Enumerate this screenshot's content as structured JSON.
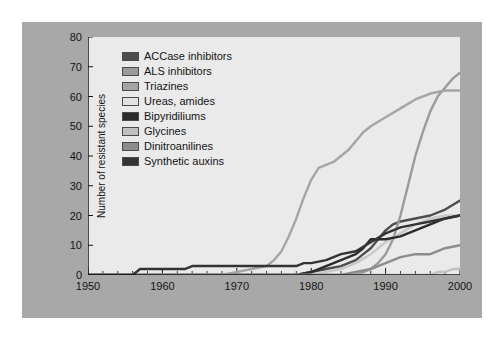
{
  "figure": {
    "background_color": "#a8a8a8",
    "plot_background_color": "#eaeaea",
    "page_color": "#ffffff"
  },
  "chart_data": {
    "type": "line",
    "title": "",
    "subtitle": "",
    "xlabel": "",
    "ylabel": "Number of resistant species",
    "xlim": [
      1950,
      2000
    ],
    "ylim": [
      0,
      80
    ],
    "xticks": [
      1950,
      1960,
      1970,
      1980,
      1990,
      2000
    ],
    "xtick_labels": [
      "1950",
      "1960",
      "1970",
      "1980",
      "1990",
      "2000"
    ],
    "yticks": [
      0,
      10,
      20,
      30,
      40,
      50,
      60,
      70,
      80
    ],
    "ytick_labels": [
      "0",
      "10",
      "20",
      "30",
      "40",
      "50",
      "60",
      "70",
      "80"
    ],
    "minor_ticks_x": true,
    "minor_tick_interval_x": 2,
    "grid": false,
    "legend_position": "upper left (inside axes)",
    "series": [
      {
        "name": "ACCase inhibitors",
        "color": "#4d4d4d",
        "x": [
          1950,
          1978,
          1980,
          1982,
          1984,
          1986,
          1987,
          1988,
          1989,
          1990,
          1991,
          1992,
          1994,
          1996,
          1998,
          2000
        ],
        "values": [
          0,
          0,
          1,
          2,
          3,
          5,
          7,
          9,
          12,
          15,
          17,
          18,
          19,
          20,
          22,
          25
        ]
      },
      {
        "name": "ALS inhibitors",
        "color": "#9a9a9a",
        "x": [
          1950,
          1986,
          1987,
          1988,
          1989,
          1990,
          1991,
          1992,
          1993,
          1994,
          1995,
          1996,
          1997,
          1998,
          1999,
          2000
        ],
        "values": [
          0,
          0,
          1,
          2,
          4,
          7,
          12,
          20,
          30,
          40,
          48,
          55,
          60,
          63,
          66,
          68
        ]
      },
      {
        "name": "Triazines",
        "color": "#a5a5a5",
        "x": [
          1950,
          1968,
          1970,
          1972,
          1974,
          1975,
          1976,
          1977,
          1978,
          1979,
          1980,
          1981,
          1982,
          1983,
          1984,
          1985,
          1986,
          1987,
          1988,
          1990,
          1992,
          1994,
          1996,
          1998,
          2000
        ],
        "values": [
          0,
          0,
          1,
          2,
          3,
          5,
          8,
          13,
          19,
          26,
          32,
          36,
          37,
          38,
          40,
          42,
          45,
          48,
          50,
          53,
          56,
          59,
          61,
          62,
          62
        ]
      },
      {
        "name": "Ureas, amides",
        "color": "#c9c9c9",
        "x": [
          1950,
          1980,
          1982,
          1984,
          1986,
          1988,
          1990,
          1992,
          1994,
          1996,
          1998,
          2000
        ],
        "values": [
          0,
          0,
          1,
          2,
          4,
          7,
          11,
          14,
          17,
          19,
          20,
          20
        ]
      },
      {
        "name": "Bipyridiliums",
        "color": "#2b2b2b",
        "x": [
          1950,
          1978,
          1980,
          1982,
          1984,
          1986,
          1987,
          1988,
          1990,
          1992,
          1994,
          1996,
          1998,
          2000
        ],
        "values": [
          0,
          0,
          1,
          3,
          5,
          7,
          9,
          12,
          12,
          13,
          15,
          17,
          19,
          20
        ]
      },
      {
        "name": "Glycines",
        "color": "#c0c0c0",
        "x": [
          1950,
          1994,
          1996,
          1997,
          1998,
          1999,
          2000
        ],
        "values": [
          0,
          0,
          0,
          1,
          1,
          2,
          2
        ]
      },
      {
        "name": "Dinitroanilines",
        "color": "#8c8c8c",
        "x": [
          1950,
          1984,
          1986,
          1988,
          1990,
          1992,
          1994,
          1996,
          1998,
          2000
        ],
        "values": [
          0,
          0,
          1,
          2,
          4,
          6,
          7,
          7,
          9,
          10
        ]
      },
      {
        "name": "Synthetic auxins",
        "color": "#333333",
        "x": [
          1950,
          1956,
          1957,
          1963,
          1964,
          1970,
          1971,
          1978,
          1979,
          1980,
          1982,
          1984,
          1986,
          1988,
          1990,
          1992,
          1994,
          1996,
          1998,
          2000
        ],
        "values": [
          0,
          0,
          2,
          2,
          3,
          3,
          3,
          3,
          4,
          4,
          5,
          7,
          8,
          11,
          14,
          16,
          17,
          18,
          19,
          20
        ]
      }
    ]
  },
  "legend": {
    "items": [
      {
        "label": "ACCase inhibitors",
        "color": "#4d4d4d"
      },
      {
        "label": "ALS inhibitors",
        "color": "#9a9a9a"
      },
      {
        "label": "Triazines",
        "color": "#a5a5a5"
      },
      {
        "label": "Ureas, amides",
        "color": "#e2e2e2"
      },
      {
        "label": "Bipyridiliums",
        "color": "#2b2b2b"
      },
      {
        "label": "Glycines",
        "color": "#c0c0c0"
      },
      {
        "label": "Dinitroanilines",
        "color": "#8c8c8c"
      },
      {
        "label": "Synthetic auxins",
        "color": "#333333"
      }
    ]
  }
}
